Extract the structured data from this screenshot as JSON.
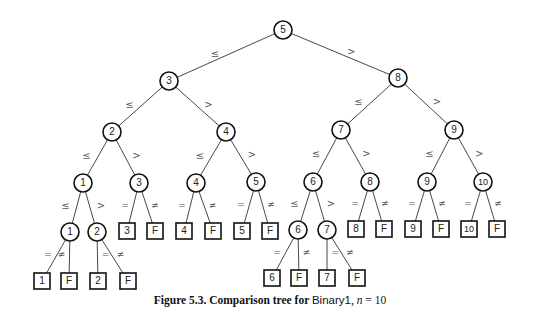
{
  "figure": {
    "caption_prefix": "Figure 5.3.  Comparison tree for ",
    "caption_algorithm": "Binary1",
    "caption_sep": ", ",
    "caption_var": "n",
    "caption_eq": " = 10"
  },
  "colors": {
    "line": "#333333",
    "node_stroke": "#111111",
    "text": "#222222",
    "label": "#555555"
  },
  "tree": {
    "nodes": [
      {
        "id": "c5",
        "shape": "circle",
        "label": "5",
        "x": 283,
        "y": 30
      },
      {
        "id": "c3",
        "shape": "circle",
        "label": "3",
        "x": 169,
        "y": 81
      },
      {
        "id": "c8",
        "shape": "circle",
        "label": "8",
        "x": 398,
        "y": 78
      },
      {
        "id": "c2",
        "shape": "circle",
        "label": "2",
        "x": 112,
        "y": 132
      },
      {
        "id": "c4",
        "shape": "circle",
        "label": "4",
        "x": 226,
        "y": 132
      },
      {
        "id": "c7",
        "shape": "circle",
        "label": "7",
        "x": 341,
        "y": 130
      },
      {
        "id": "c9",
        "shape": "circle",
        "label": "9",
        "x": 454,
        "y": 130
      },
      {
        "id": "c1a",
        "shape": "circle",
        "label": "1",
        "x": 83,
        "y": 183
      },
      {
        "id": "c3b",
        "shape": "circle",
        "label": "3",
        "x": 139,
        "y": 183
      },
      {
        "id": "c4b",
        "shape": "circle",
        "label": "4",
        "x": 196,
        "y": 183
      },
      {
        "id": "c5b",
        "shape": "circle",
        "label": "5",
        "x": 256,
        "y": 182
      },
      {
        "id": "c6a",
        "shape": "circle",
        "label": "6",
        "x": 313,
        "y": 182
      },
      {
        "id": "c8b",
        "shape": "circle",
        "label": "8",
        "x": 370,
        "y": 182
      },
      {
        "id": "c9b",
        "shape": "circle",
        "label": "9",
        "x": 427,
        "y": 182
      },
      {
        "id": "c10",
        "shape": "circle",
        "label": "10",
        "x": 483,
        "y": 182
      },
      {
        "id": "c1b",
        "shape": "circle",
        "label": "1",
        "x": 70,
        "y": 232
      },
      {
        "id": "c2b",
        "shape": "circle",
        "label": "2",
        "x": 97,
        "y": 232
      },
      {
        "id": "c6b",
        "shape": "circle",
        "label": "6",
        "x": 298,
        "y": 230
      },
      {
        "id": "c7b",
        "shape": "circle",
        "label": "7",
        "x": 327,
        "y": 230
      },
      {
        "id": "s3",
        "shape": "square",
        "label": "3",
        "x": 127,
        "y": 231
      },
      {
        "id": "sF3",
        "shape": "square",
        "label": "F",
        "x": 155,
        "y": 231
      },
      {
        "id": "s4",
        "shape": "square",
        "label": "4",
        "x": 184,
        "y": 231
      },
      {
        "id": "sF4",
        "shape": "square",
        "label": "F",
        "x": 213,
        "y": 231
      },
      {
        "id": "s5",
        "shape": "square",
        "label": "5",
        "x": 242,
        "y": 231
      },
      {
        "id": "sF5",
        "shape": "square",
        "label": "F",
        "x": 270,
        "y": 231
      },
      {
        "id": "s8",
        "shape": "square",
        "label": "8",
        "x": 356,
        "y": 229
      },
      {
        "id": "sF8",
        "shape": "square",
        "label": "F",
        "x": 384,
        "y": 229
      },
      {
        "id": "s9",
        "shape": "square",
        "label": "9",
        "x": 413,
        "y": 229
      },
      {
        "id": "sF9",
        "shape": "square",
        "label": "F",
        "x": 441,
        "y": 229
      },
      {
        "id": "s10",
        "shape": "square",
        "label": "10",
        "x": 469,
        "y": 229
      },
      {
        "id": "sF10",
        "shape": "square",
        "label": "F",
        "x": 497,
        "y": 229
      },
      {
        "id": "s1",
        "shape": "square",
        "label": "1",
        "x": 42,
        "y": 281
      },
      {
        "id": "sF1",
        "shape": "square",
        "label": "F",
        "x": 69,
        "y": 281
      },
      {
        "id": "s2",
        "shape": "square",
        "label": "2",
        "x": 98,
        "y": 281
      },
      {
        "id": "sF2",
        "shape": "square",
        "label": "F",
        "x": 128,
        "y": 281
      },
      {
        "id": "s6",
        "shape": "square",
        "label": "6",
        "x": 272,
        "y": 278
      },
      {
        "id": "sF6",
        "shape": "square",
        "label": "F",
        "x": 299,
        "y": 278
      },
      {
        "id": "s7",
        "shape": "square",
        "label": "7",
        "x": 327,
        "y": 278
      },
      {
        "id": "sF7",
        "shape": "square",
        "label": "F",
        "x": 357,
        "y": 278
      }
    ],
    "edges": [
      {
        "from": "c5",
        "to": "c3",
        "label": "≤"
      },
      {
        "from": "c5",
        "to": "c8",
        "label": ">"
      },
      {
        "from": "c3",
        "to": "c2",
        "label": "≤"
      },
      {
        "from": "c3",
        "to": "c4",
        "label": ">"
      },
      {
        "from": "c8",
        "to": "c7",
        "label": "≤"
      },
      {
        "from": "c8",
        "to": "c9",
        "label": ">"
      },
      {
        "from": "c2",
        "to": "c1a",
        "label": "≤"
      },
      {
        "from": "c2",
        "to": "c3b",
        "label": ">"
      },
      {
        "from": "c4",
        "to": "c4b",
        "label": "≤"
      },
      {
        "from": "c4",
        "to": "c5b",
        "label": ">"
      },
      {
        "from": "c7",
        "to": "c6a",
        "label": "≤"
      },
      {
        "from": "c7",
        "to": "c8b",
        "label": ">"
      },
      {
        "from": "c9",
        "to": "c9b",
        "label": "≤"
      },
      {
        "from": "c9",
        "to": "c10",
        "label": ">"
      },
      {
        "from": "c1a",
        "to": "c1b",
        "label": "≤"
      },
      {
        "from": "c1a",
        "to": "c2b",
        "label": ">"
      },
      {
        "from": "c3b",
        "to": "s3",
        "label": "="
      },
      {
        "from": "c3b",
        "to": "sF3",
        "label": "≠"
      },
      {
        "from": "c4b",
        "to": "s4",
        "label": "="
      },
      {
        "from": "c4b",
        "to": "sF4",
        "label": "≠"
      },
      {
        "from": "c5b",
        "to": "s5",
        "label": "="
      },
      {
        "from": "c5b",
        "to": "sF5",
        "label": "≠"
      },
      {
        "from": "c6a",
        "to": "c6b",
        "label": "≤"
      },
      {
        "from": "c6a",
        "to": "c7b",
        "label": ">"
      },
      {
        "from": "c8b",
        "to": "s8",
        "label": "="
      },
      {
        "from": "c8b",
        "to": "sF8",
        "label": "≠"
      },
      {
        "from": "c9b",
        "to": "s9",
        "label": "="
      },
      {
        "from": "c9b",
        "to": "sF9",
        "label": "≠"
      },
      {
        "from": "c10",
        "to": "s10",
        "label": "="
      },
      {
        "from": "c10",
        "to": "sF10",
        "label": "≠"
      },
      {
        "from": "c1b",
        "to": "s1",
        "label": "="
      },
      {
        "from": "c1b",
        "to": "sF1",
        "label": "≠"
      },
      {
        "from": "c2b",
        "to": "s2",
        "label": "="
      },
      {
        "from": "c2b",
        "to": "sF2",
        "label": "≠"
      },
      {
        "from": "c6b",
        "to": "s6",
        "label": "="
      },
      {
        "from": "c6b",
        "to": "sF6",
        "label": "≠"
      },
      {
        "from": "c7b",
        "to": "s7",
        "label": "="
      },
      {
        "from": "c7b",
        "to": "sF7",
        "label": "≠"
      }
    ]
  }
}
